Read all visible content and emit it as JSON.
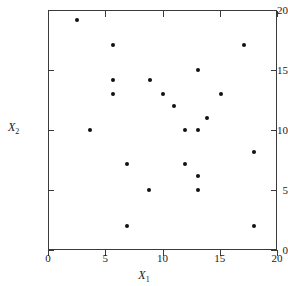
{
  "chart_data": {
    "type": "scatter",
    "title": "",
    "xlabel": "X1",
    "ylabel": "X2",
    "xlim": [
      0,
      20
    ],
    "ylim": [
      0,
      20
    ],
    "grid": false,
    "legend": null,
    "x_ticks": [
      "0",
      "5",
      "10",
      "15",
      "20"
    ],
    "y_ticks": [
      "0",
      "5",
      "10",
      "15",
      "20"
    ],
    "x_tick_values": [
      0,
      5,
      10,
      15,
      20
    ],
    "y_tick_values": [
      0,
      5,
      10,
      15,
      20
    ],
    "points": [
      {
        "x": 2.5,
        "y": 19.2
      },
      {
        "x": 5.7,
        "y": 17.1
      },
      {
        "x": 17.1,
        "y": 17.1
      },
      {
        "x": 13.1,
        "y": 15.0
      },
      {
        "x": 5.7,
        "y": 14.2
      },
      {
        "x": 8.9,
        "y": 14.2
      },
      {
        "x": 5.7,
        "y": 13.0
      },
      {
        "x": 10.0,
        "y": 13.0
      },
      {
        "x": 15.1,
        "y": 13.0
      },
      {
        "x": 11.0,
        "y": 12.0
      },
      {
        "x": 13.9,
        "y": 11.0
      },
      {
        "x": 3.7,
        "y": 10.0
      },
      {
        "x": 12.0,
        "y": 10.0
      },
      {
        "x": 13.1,
        "y": 10.0
      },
      {
        "x": 18.0,
        "y": 8.2
      },
      {
        "x": 6.9,
        "y": 7.2
      },
      {
        "x": 12.0,
        "y": 7.2
      },
      {
        "x": 13.1,
        "y": 6.2
      },
      {
        "x": 8.8,
        "y": 5.0
      },
      {
        "x": 13.1,
        "y": 5.0
      },
      {
        "x": 6.9,
        "y": 2.0
      },
      {
        "x": 18.0,
        "y": 2.0
      }
    ]
  },
  "axis_titles": {
    "x_main": "X",
    "x_sub": "1",
    "y_main": "X",
    "y_sub": "2"
  },
  "colors": {
    "point": "#111111",
    "axis": "#3a3a3a",
    "background": "#ffffff",
    "text": "#1a1a1a"
  }
}
